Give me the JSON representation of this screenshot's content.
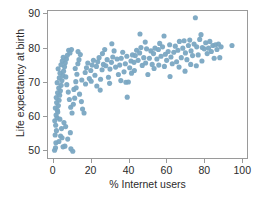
{
  "chart_data": {
    "type": "scatter",
    "title": "",
    "xlabel": "% Internet users",
    "ylabel": "Life expectancy at birth",
    "xlim": [
      -3,
      103
    ],
    "ylim": [
      47.5,
      91
    ],
    "xticks": [
      0,
      20,
      40,
      60,
      80,
      100
    ],
    "yticks": [
      50,
      60,
      70,
      80,
      90
    ],
    "grid": false,
    "legend": null,
    "marker": {
      "color": "#7aa6c2",
      "size": 2.6,
      "shape": "circle",
      "opacity": 0.95
    },
    "frame_color": "#9a9a9a",
    "background": "#ffffff",
    "n_points": 186,
    "points": [
      [
        0.5,
        49.8
      ],
      [
        1.0,
        50.5
      ],
      [
        1.2,
        52.0
      ],
      [
        0.8,
        54.3
      ],
      [
        1.5,
        55.6
      ],
      [
        1.1,
        57.2
      ],
      [
        0.6,
        58.5
      ],
      [
        1.8,
        59.4
      ],
      [
        1.3,
        60.2
      ],
      [
        2.2,
        61.1
      ],
      [
        0.9,
        62.3
      ],
      [
        2.5,
        63.0
      ],
      [
        1.6,
        63.9
      ],
      [
        2.9,
        64.6
      ],
      [
        1.4,
        65.4
      ],
      [
        3.2,
        66.1
      ],
      [
        2.1,
        66.8
      ],
      [
        3.6,
        67.4
      ],
      [
        2.7,
        68.2
      ],
      [
        4.0,
        69.0
      ],
      [
        1.9,
        69.8
      ],
      [
        4.4,
        70.4
      ],
      [
        3.0,
        71.2
      ],
      [
        4.9,
        71.9
      ],
      [
        3.4,
        72.6
      ],
      [
        5.3,
        73.2
      ],
      [
        2.4,
        73.9
      ],
      [
        5.8,
        74.5
      ],
      [
        3.9,
        75.1
      ],
      [
        6.2,
        75.7
      ],
      [
        4.6,
        76.2
      ],
      [
        6.8,
        76.8
      ],
      [
        5.1,
        77.3
      ],
      [
        7.3,
        77.9
      ],
      [
        8.0,
        79.4
      ],
      [
        9.5,
        79.6
      ],
      [
        8.7,
        78.6
      ],
      [
        6.5,
        71.5
      ],
      [
        7.0,
        69.2
      ],
      [
        7.8,
        67.0
      ],
      [
        8.4,
        64.8
      ],
      [
        9.1,
        62.5
      ],
      [
        9.8,
        60.8
      ],
      [
        5.5,
        58.0
      ],
      [
        4.2,
        56.2
      ],
      [
        3.7,
        54.0
      ],
      [
        2.8,
        52.4
      ],
      [
        6.0,
        51.0
      ],
      [
        7.5,
        53.1
      ],
      [
        8.9,
        55.0
      ],
      [
        10.2,
        49.5
      ],
      [
        9.2,
        50.2
      ],
      [
        5.0,
        50.8
      ],
      [
        4.5,
        53.5
      ],
      [
        6.4,
        56.8
      ],
      [
        3.3,
        59.0
      ],
      [
        2.0,
        61.6
      ],
      [
        10.5,
        63.4
      ],
      [
        11.2,
        65.2
      ],
      [
        10.8,
        67.8
      ],
      [
        11.8,
        70.1
      ],
      [
        12.4,
        72.3
      ],
      [
        11.5,
        74.0
      ],
      [
        12.9,
        75.4
      ],
      [
        13.5,
        76.6
      ],
      [
        14.2,
        78.1
      ],
      [
        13.0,
        79.0
      ],
      [
        12.0,
        68.3
      ],
      [
        13.8,
        66.4
      ],
      [
        14.8,
        64.2
      ],
      [
        15.4,
        62.0
      ],
      [
        16.2,
        60.8
      ],
      [
        15.0,
        70.6
      ],
      [
        16.8,
        72.8
      ],
      [
        17.5,
        74.2
      ],
      [
        18.2,
        75.6
      ],
      [
        17.0,
        69.4
      ],
      [
        19.0,
        71.0
      ],
      [
        19.8,
        73.4
      ],
      [
        20.5,
        75.0
      ],
      [
        21.2,
        76.4
      ],
      [
        20.0,
        70.2
      ],
      [
        22.0,
        72.0
      ],
      [
        22.8,
        74.6
      ],
      [
        23.5,
        76.0
      ],
      [
        24.2,
        77.2
      ],
      [
        23.0,
        68.8
      ],
      [
        25.0,
        70.8
      ],
      [
        25.8,
        73.6
      ],
      [
        26.5,
        75.2
      ],
      [
        26.0,
        78.4
      ],
      [
        27.2,
        79.6
      ],
      [
        27.8,
        74.8
      ],
      [
        28.5,
        76.6
      ],
      [
        24.8,
        67.6
      ],
      [
        29.2,
        71.4
      ],
      [
        30.0,
        73.8
      ],
      [
        30.8,
        75.8
      ],
      [
        31.5,
        77.4
      ],
      [
        31.0,
        81.3
      ],
      [
        32.2,
        79.2
      ],
      [
        33.0,
        74.4
      ],
      [
        33.8,
        76.8
      ],
      [
        29.8,
        69.6
      ],
      [
        34.5,
        72.2
      ],
      [
        35.2,
        75.0
      ],
      [
        36.0,
        77.0
      ],
      [
        36.8,
        78.8
      ],
      [
        35.8,
        70.4
      ],
      [
        37.5,
        73.0
      ],
      [
        38.2,
        75.4
      ],
      [
        39.0,
        77.6
      ],
      [
        38.5,
        69.9
      ],
      [
        39.8,
        70.0
      ],
      [
        39.2,
        65.5
      ],
      [
        40.5,
        74.2
      ],
      [
        41.2,
        76.2
      ],
      [
        42.0,
        78.0
      ],
      [
        41.5,
        72.6
      ],
      [
        42.8,
        75.8
      ],
      [
        43.5,
        77.8
      ],
      [
        44.2,
        79.4
      ],
      [
        43.0,
        73.4
      ],
      [
        45.0,
        76.4
      ],
      [
        45.8,
        78.6
      ],
      [
        46.5,
        80.2
      ],
      [
        46.0,
        84.2
      ],
      [
        47.2,
        74.9
      ],
      [
        48.0,
        77.2
      ],
      [
        48.8,
        81.8
      ],
      [
        49.5,
        79.8
      ],
      [
        49.0,
        75.6
      ],
      [
        50.2,
        72.2
      ],
      [
        51.0,
        77.0
      ],
      [
        51.8,
        79.2
      ],
      [
        52.5,
        75.2
      ],
      [
        53.2,
        78.4
      ],
      [
        54.0,
        80.0
      ],
      [
        53.5,
        74.0
      ],
      [
        55.0,
        76.8
      ],
      [
        55.8,
        79.6
      ],
      [
        56.5,
        81.4
      ],
      [
        56.0,
        75.0
      ],
      [
        57.2,
        77.6
      ],
      [
        58.0,
        80.4
      ],
      [
        58.8,
        83.6
      ],
      [
        59.5,
        78.2
      ],
      [
        59.0,
        74.6
      ],
      [
        60.2,
        76.4
      ],
      [
        61.0,
        79.0
      ],
      [
        61.8,
        81.0
      ],
      [
        62.5,
        77.4
      ],
      [
        62.0,
        71.6
      ],
      [
        63.2,
        75.4
      ],
      [
        64.0,
        78.8
      ],
      [
        64.8,
        80.6
      ],
      [
        65.5,
        76.0
      ],
      [
        66.2,
        79.4
      ],
      [
        67.0,
        82.0
      ],
      [
        66.8,
        74.4
      ],
      [
        68.0,
        77.2
      ],
      [
        68.8,
        80.0
      ],
      [
        69.5,
        82.2
      ],
      [
        70.2,
        78.6
      ],
      [
        70.0,
        73.2
      ],
      [
        71.0,
        76.6
      ],
      [
        71.8,
        80.8
      ],
      [
        72.5,
        82.4
      ],
      [
        73.2,
        79.2
      ],
      [
        73.0,
        75.2
      ],
      [
        74.0,
        77.8
      ],
      [
        74.8,
        81.2
      ],
      [
        75.5,
        89.0
      ],
      [
        76.2,
        80.4
      ],
      [
        76.0,
        74.8
      ],
      [
        77.0,
        78.0
      ],
      [
        77.8,
        82.6
      ],
      [
        78.5,
        84.0
      ],
      [
        79.2,
        80.2
      ],
      [
        79.0,
        76.2
      ],
      [
        80.2,
        79.8
      ],
      [
        81.0,
        81.6
      ],
      [
        81.8,
        78.4
      ],
      [
        82.5,
        80.0
      ],
      [
        83.2,
        82.0
      ],
      [
        84.0,
        79.0
      ],
      [
        84.8,
        80.8
      ],
      [
        85.5,
        77.0
      ],
      [
        86.2,
        81.0
      ],
      [
        87.0,
        79.6
      ],
      [
        87.8,
        81.2
      ],
      [
        88.5,
        77.2
      ],
      [
        89.2,
        80.4
      ],
      [
        95.0,
        80.8
      ]
    ]
  },
  "axis": {
    "x_tick_labels": [
      "0",
      "20",
      "40",
      "60",
      "80",
      "100"
    ],
    "y_tick_labels": [
      "50",
      "60",
      "70",
      "80",
      "90"
    ]
  }
}
